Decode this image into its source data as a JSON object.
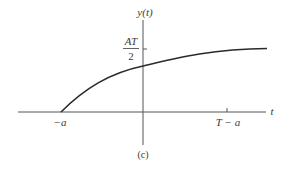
{
  "figure": {
    "caption": "(c)",
    "y_axis_label": "y(t)",
    "x_axis_label": "t",
    "ytick_label": {
      "numerator": "AT",
      "denominator": "2"
    },
    "xtick_labels": [
      "−a",
      "T − a"
    ]
  },
  "colors": {
    "axis": "#555555",
    "curve": "#2a2a2a",
    "text": "#3a3a3a"
  },
  "curve": {
    "description": "y(t) rises from 0 at t = −a, curving concavely upward toward AT/2 near t = T − a and leveling off",
    "points_data_units": [
      {
        "t": "-a",
        "y": 0
      },
      {
        "t": 0,
        "y": "≈0.74·AT/2"
      },
      {
        "t": "T-a",
        "y": "≈AT/2"
      }
    ]
  }
}
